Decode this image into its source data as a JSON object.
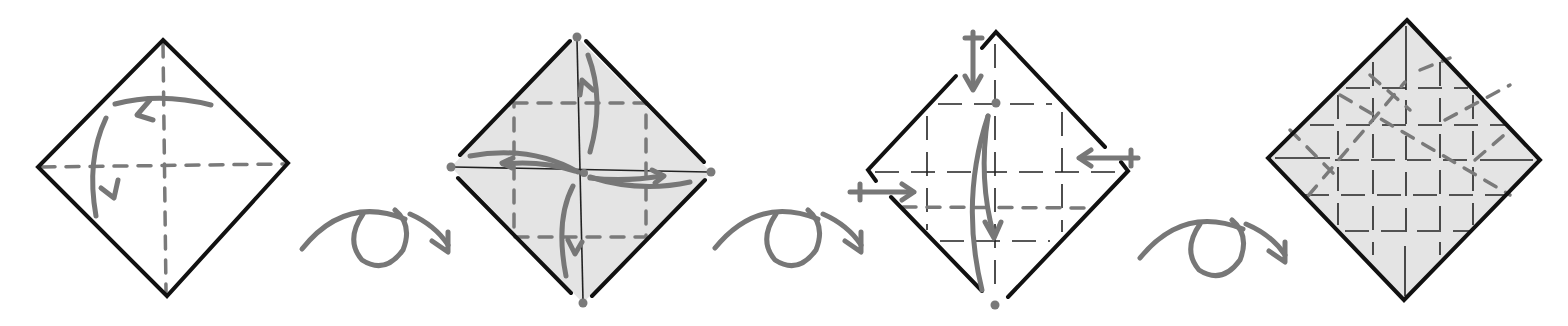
{
  "diagram": {
    "type": "origami-folding-sequence",
    "colors": {
      "background": "#ffffff",
      "edge": "#111111",
      "arrow": "#777777",
      "valley_crease": "#7a7a7a",
      "shade": "#e4e4e4"
    },
    "steps": [
      {
        "index": 1,
        "description": "Square paper as diamond, white side up, with dashed center creases; fold and unfold along both diagonals",
        "icons": [
          "curved-fold-arrow",
          "curved-fold-arrow"
        ]
      },
      {
        "index": 2,
        "description": "Colored side up; blintz fold corners to center with square of dashed lines",
        "icons": [
          "curved-fold-arrow",
          "curved-fold-arrow",
          "curved-fold-arrow",
          "curved-fold-arrow",
          "reference-dot"
        ]
      },
      {
        "index": 3,
        "description": "Fold top corner down to bottom, reference dots and push arrows",
        "icons": [
          "push-arrow",
          "push-arrow",
          "push-arrow",
          "curved-fold-arrow",
          "reference-dot"
        ]
      },
      {
        "index": 4,
        "description": "Resulting crease pattern grid with diagonal creases, colored side",
        "icons": []
      }
    ],
    "transitions": [
      {
        "after_step": 1,
        "symbol": "turn-over-arrow"
      },
      {
        "after_step": 2,
        "symbol": "turn-over-arrow"
      },
      {
        "after_step": 3,
        "symbol": "turn-over-arrow"
      }
    ]
  }
}
